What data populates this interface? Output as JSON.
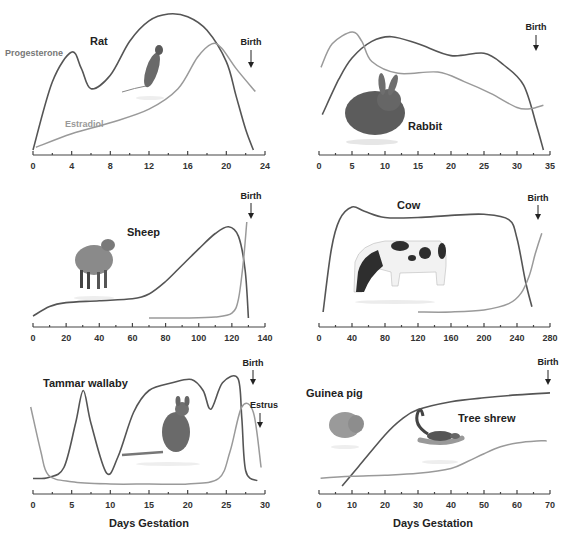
{
  "colors": {
    "progesterone": "#555555",
    "estradiol": "#9a9a9a",
    "axis": "#444444",
    "text": "#222222"
  },
  "legend": {
    "progesterone": "Progesterone",
    "estradiol": "Estradiol"
  },
  "xlabel": "Days Gestation",
  "chart_data": [
    {
      "type": "line",
      "title": "Rat",
      "xlabel": "",
      "ylabel": "",
      "xlim": [
        0,
        24
      ],
      "xticks": [
        0,
        4,
        8,
        12,
        16,
        20,
        24
      ],
      "annotations": [
        {
          "text": "Birth",
          "x": 22.5,
          "arrow": "down"
        }
      ],
      "legend_labels": [
        "Progesterone",
        "Estradiol"
      ],
      "series": [
        {
          "name": "Progesterone",
          "x": [
            0,
            2,
            4,
            5,
            6,
            8,
            10,
            12,
            14,
            16,
            18,
            20,
            21,
            22,
            22.8
          ],
          "y": [
            0,
            50,
            72,
            60,
            45,
            55,
            80,
            95,
            100,
            98,
            88,
            65,
            40,
            15,
            0
          ]
        },
        {
          "name": "Estradiol",
          "x": [
            0.3,
            4,
            8,
            12,
            15,
            17,
            18.5,
            19.5,
            21,
            23
          ],
          "y": [
            2,
            12,
            20,
            30,
            45,
            68,
            78,
            75,
            60,
            43
          ]
        }
      ]
    },
    {
      "type": "line",
      "title": "Rabbit",
      "xlim": [
        0,
        35
      ],
      "xticks": [
        0,
        5,
        10,
        15,
        20,
        25,
        30,
        35
      ],
      "annotations": [
        {
          "text": "Birth",
          "x": 33,
          "arrow": "down"
        }
      ],
      "series": [
        {
          "name": "Progesterone",
          "x": [
            0.5,
            3,
            5,
            8,
            11,
            15,
            20,
            25,
            28,
            31,
            33,
            34
          ],
          "y": [
            30,
            60,
            78,
            92,
            96,
            90,
            80,
            82,
            72,
            55,
            20,
            0
          ]
        },
        {
          "name": "Estradiol",
          "x": [
            0.3,
            2,
            5,
            6.5,
            8,
            12,
            18,
            22,
            26,
            30,
            32,
            34
          ],
          "y": [
            70,
            90,
            100,
            92,
            75,
            65,
            66,
            58,
            48,
            36,
            35,
            38
          ]
        }
      ]
    },
    {
      "type": "line",
      "title": "Sheep",
      "xlim": [
        0,
        140
      ],
      "xticks": [
        0,
        20,
        40,
        60,
        80,
        100,
        120,
        140
      ],
      "annotations": [
        {
          "text": "Birth",
          "x": 131,
          "arrow": "down"
        }
      ],
      "series": [
        {
          "name": "Progesterone",
          "x": [
            0,
            10,
            20,
            40,
            60,
            70,
            80,
            90,
            100,
            110,
            118,
            124,
            128,
            130
          ],
          "y": [
            2,
            12,
            16,
            18,
            20,
            25,
            38,
            55,
            72,
            88,
            95,
            85,
            50,
            0
          ]
        },
        {
          "name": "Estradiol",
          "x": [
            70,
            90,
            110,
            120,
            124,
            127,
            129
          ],
          "y": [
            0,
            0,
            1,
            5,
            20,
            60,
            100
          ]
        }
      ]
    },
    {
      "type": "line",
      "title": "Cow",
      "xlim": [
        0,
        280
      ],
      "xticks": [
        0,
        40,
        80,
        120,
        160,
        200,
        240,
        280
      ],
      "annotations": [
        {
          "text": "Birth",
          "x": 265,
          "arrow": "down"
        }
      ],
      "series": [
        {
          "name": "Progesterone",
          "x": [
            5,
            15,
            25,
            40,
            55,
            80,
            120,
            160,
            200,
            230,
            240,
            250,
            258
          ],
          "y": [
            0,
            60,
            88,
            100,
            96,
            90,
            90,
            92,
            93,
            88,
            70,
            30,
            5
          ]
        },
        {
          "name": "Estradiol",
          "x": [
            120,
            160,
            200,
            230,
            245,
            255,
            262,
            270
          ],
          "y": [
            0,
            0,
            2,
            8,
            18,
            35,
            55,
            75
          ]
        }
      ]
    },
    {
      "type": "line",
      "title": "Tammar wallaby",
      "xlim": [
        0,
        30
      ],
      "xticks": [
        0,
        5,
        10,
        15,
        20,
        25,
        30
      ],
      "annotations": [
        {
          "text": "Birth",
          "x": 28.5,
          "arrow": "down"
        },
        {
          "text": "Estrus",
          "x": 29.5,
          "arrow": "down"
        }
      ],
      "series": [
        {
          "name": "Progesterone",
          "x": [
            0,
            2,
            4,
            5.5,
            6.5,
            7.5,
            9.5,
            11,
            13,
            15,
            18,
            20.5,
            22,
            23,
            24.5,
            26.5,
            27,
            27.5,
            29
          ],
          "y": [
            5,
            6,
            15,
            55,
            85,
            55,
            10,
            25,
            65,
            85,
            92,
            95,
            85,
            68,
            92,
            96,
            60,
            12,
            3
          ]
        },
        {
          "name": "Estradiol",
          "x": [
            -0.3,
            1,
            2,
            5,
            10,
            15,
            20,
            24,
            25.5,
            27,
            28.5,
            29.5
          ],
          "y": [
            70,
            30,
            8,
            2,
            0,
            0,
            0,
            5,
            30,
            70,
            65,
            15
          ]
        }
      ]
    },
    {
      "type": "line",
      "title": "Guinea pig",
      "subtitle": "Tree shrew",
      "xlim": [
        0,
        70
      ],
      "xticks": [
        0,
        10,
        20,
        30,
        40,
        50,
        60,
        70
      ],
      "annotations": [
        {
          "text": "Birth",
          "x": 69,
          "arrow": "down"
        }
      ],
      "series": [
        {
          "name": "Progesterone",
          "x": [
            7,
            12,
            20,
            25,
            30,
            40,
            50,
            60,
            70
          ],
          "y": [
            0,
            20,
            52,
            68,
            78,
            86,
            90,
            93,
            95
          ]
        },
        {
          "name": "Estradiol",
          "x": [
            0.5,
            10,
            20,
            30,
            40,
            45,
            50,
            55,
            60,
            66,
            69
          ],
          "y": [
            8,
            10,
            11,
            13,
            18,
            25,
            33,
            40,
            44,
            46,
            46
          ]
        }
      ]
    }
  ],
  "panels": [
    {
      "title": "Rat",
      "ticks": [
        "0",
        "4",
        "8",
        "12",
        "16",
        "20",
        "24"
      ],
      "birth": "Birth"
    },
    {
      "title": "Rabbit",
      "ticks": [
        "0",
        "5",
        "10",
        "15",
        "20",
        "25",
        "30",
        "35"
      ],
      "birth": "Birth"
    },
    {
      "title": "Sheep",
      "ticks": [
        "0",
        "20",
        "40",
        "60",
        "80",
        "100",
        "120",
        "140"
      ],
      "birth": "Birth"
    },
    {
      "title": "Cow",
      "ticks": [
        "0",
        "40",
        "80",
        "120",
        "160",
        "200",
        "240",
        "280"
      ],
      "birth": "Birth"
    },
    {
      "title": "Tammar wallaby",
      "ticks": [
        "0",
        "5",
        "10",
        "15",
        "20",
        "25",
        "30"
      ],
      "birth": "Birth",
      "estrus": "Estrus"
    },
    {
      "title": "Guinea pig",
      "subtitle": "Tree shrew",
      "ticks": [
        "0",
        "10",
        "20",
        "30",
        "40",
        "50",
        "60",
        "70"
      ],
      "birth": "Birth"
    }
  ],
  "images": [
    "rat",
    "rabbit",
    "sheep",
    "cow",
    "wallaby",
    "guinea-pig",
    "tree-shrew"
  ]
}
